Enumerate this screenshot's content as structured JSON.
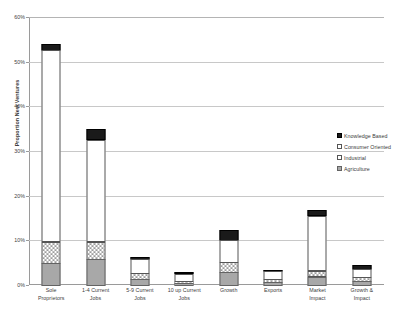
{
  "chart_data": {
    "type": "bar",
    "subtype": "stacked-column",
    "title": "",
    "xlabel": "",
    "ylabel": "Proportion New Ventures",
    "ylim": [
      0,
      60
    ],
    "y_tick_labels": [
      "0%",
      "10%",
      "20%",
      "30%",
      "40%",
      "50%",
      "60%"
    ],
    "y_tick_values": [
      0,
      10,
      20,
      30,
      40,
      50,
      60
    ],
    "grid": "horizontal",
    "legend_position": "right",
    "categories": [
      "Sole Proprietors",
      "1-4 Current Jobs",
      "5-9 Current Jobs",
      "10 up Current Jobs",
      "Growth",
      "Exports",
      "Market Impact",
      "Growth & Impact"
    ],
    "category_lines": [
      [
        "Sole",
        "Proprietors"
      ],
      [
        "1-4 Current",
        "Jobs"
      ],
      [
        "5-9 Current",
        "Jobs"
      ],
      [
        "10 up Current",
        "Jobs"
      ],
      [
        "Growth"
      ],
      [
        "Exports"
      ],
      [
        "Market",
        "Impact"
      ],
      [
        "Growth &",
        "Impact"
      ]
    ],
    "series": [
      {
        "name": "Agriculture",
        "color": "#a8a8a8",
        "pattern": "solid-gray",
        "values": [
          5.0,
          6.0,
          1.5,
          0.6,
          3.0,
          0.8,
          2.0,
          1.0
        ]
      },
      {
        "name": "Industrial",
        "color": "#ffffff",
        "pattern": "checkered",
        "values": [
          5.0,
          4.0,
          1.5,
          0.6,
          2.5,
          0.8,
          1.5,
          1.0
        ]
      },
      {
        "name": "Consumer Oriented",
        "color": "#ffffff",
        "pattern": "solid-white",
        "values": [
          43.0,
          23.0,
          3.3,
          1.8,
          5.0,
          2.0,
          12.5,
          2.0
        ]
      },
      {
        "name": "Knowledge Based",
        "color": "#1a1a1a",
        "pattern": "solid-black",
        "values": [
          1.5,
          2.5,
          0.7,
          0.5,
          2.5,
          0.4,
          1.5,
          1.0
        ]
      }
    ],
    "totals": [
      54.5,
      35.5,
      7.0,
      3.5,
      13.0,
      4.0,
      17.5,
      5.0
    ]
  },
  "legend": {
    "entries": [
      {
        "label": "Knowledge Based"
      },
      {
        "label": "Consumer Oriented"
      },
      {
        "label": "Industrial"
      },
      {
        "label": "Agriculture"
      }
    ]
  },
  "axis": {
    "y_title": "Proportion New Ventures"
  }
}
